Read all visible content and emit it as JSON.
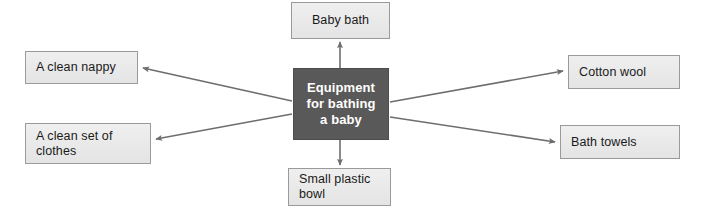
{
  "diagram": {
    "type": "spider-map",
    "title": "Equipment for bathing a baby",
    "center": {
      "id": "center",
      "label": "Equipment\nfor bathing\na baby",
      "fill": "#595959",
      "text_color": "#ffffff"
    },
    "node_fill": "#eaeaea",
    "node_border": "#9a9a9a",
    "arrow_color": "#6e6e6e",
    "nodes": [
      {
        "id": "baby-bath",
        "label": "Baby bath",
        "position": "top"
      },
      {
        "id": "clean-nappy",
        "label": "A clean nappy",
        "position": "left-upper"
      },
      {
        "id": "clean-clothes",
        "label": "A clean set of\nclothes",
        "position": "left-lower"
      },
      {
        "id": "cotton-wool",
        "label": "Cotton wool",
        "position": "right-upper"
      },
      {
        "id": "bath-towels",
        "label": "Bath towels",
        "position": "right-lower"
      },
      {
        "id": "small-bowl",
        "label": "Small plastic\nbowl",
        "position": "bottom"
      }
    ],
    "connections": [
      {
        "from": "center",
        "to": "baby-bath",
        "arrow": "to"
      },
      {
        "from": "center",
        "to": "clean-nappy",
        "arrow": "to"
      },
      {
        "from": "center",
        "to": "clean-clothes",
        "arrow": "to"
      },
      {
        "from": "center",
        "to": "cotton-wool",
        "arrow": "to"
      },
      {
        "from": "center",
        "to": "bath-towels",
        "arrow": "to"
      },
      {
        "from": "center",
        "to": "small-bowl",
        "arrow": "to"
      }
    ]
  }
}
